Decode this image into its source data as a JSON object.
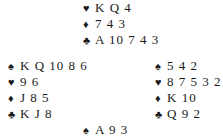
{
  "hands": {
    "north": [
      {
        "suit": "♥",
        "suit_name": "hearts",
        "cards": "K Q 4"
      },
      {
        "suit": "♦",
        "suit_name": "diamonds",
        "cards": "7 4 3"
      },
      {
        "suit": "♣",
        "suit_name": "clubs",
        "cards": "A 10 7 4 3"
      }
    ],
    "west": [
      {
        "suit": "♠",
        "suit_name": "spades",
        "cards": "K Q 10 8 6"
      },
      {
        "suit": "♥",
        "suit_name": "hearts",
        "cards": "9 6"
      },
      {
        "suit": "♦",
        "suit_name": "diamonds",
        "cards": "J 8 5"
      },
      {
        "suit": "♣",
        "suit_name": "clubs",
        "cards": "K J 8"
      }
    ],
    "east": [
      {
        "suit": "♠",
        "suit_name": "spades",
        "cards": "5 4 2"
      },
      {
        "suit": "♥",
        "suit_name": "hearts",
        "cards": "8 7 5 3 2"
      },
      {
        "suit": "♦",
        "suit_name": "diamonds",
        "cards": "K 10"
      },
      {
        "suit": "♣",
        "suit_name": "clubs",
        "cards": "Q 9 2"
      }
    ],
    "south": [
      {
        "suit": "♠",
        "suit_name": "spades",
        "cards": "A 9 3"
      }
    ]
  }
}
